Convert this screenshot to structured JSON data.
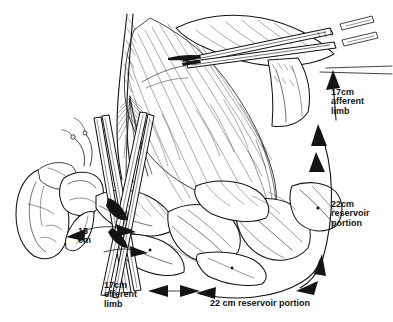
{
  "figure": {
    "background_color": "#ffffff",
    "ink_color": "#111111",
    "width": 393,
    "height": 322
  },
  "labels": {
    "afferent_limb_top": "17cm\nafferent\nlimb",
    "reservoir_right": "22cm\nreservoir\nportion",
    "ureter_segment": "15\ncm",
    "efferent_limb_bottom": "17cm\nefferent\nlimb",
    "reservoir_bottom": "22 cm  reservoir portion"
  },
  "measurements": [
    {
      "name": "afferent-limb",
      "value": "17",
      "unit": "cm",
      "text": "17cm afferent limb"
    },
    {
      "name": "reservoir-right",
      "value": "22",
      "unit": "cm",
      "text": "22cm reservoir portion"
    },
    {
      "name": "ureter-segment",
      "value": "15",
      "unit": "cm",
      "text": "15 cm"
    },
    {
      "name": "efferent-limb",
      "value": "17",
      "unit": "cm",
      "text": "17cm efferent limb"
    },
    {
      "name": "reservoir-bottom",
      "value": "22",
      "unit": "cm",
      "text": "22 cm reservoir portion"
    }
  ],
  "anatomy": [
    {
      "name": "kidney",
      "description": "left kidney, lower-left of figure"
    },
    {
      "name": "renal-pelvis",
      "description": "renal pelvis and calyces"
    },
    {
      "name": "ureter",
      "description": "ureter descending from renal pelvis"
    },
    {
      "name": "mesentery",
      "description": "fan-shaped small bowel mesentery with vessels"
    },
    {
      "name": "bowel-loops",
      "description": "coiled small bowel loops forming reservoir"
    },
    {
      "name": "afferent-limb-bowel",
      "description": "afferent bowel limb at upper right"
    },
    {
      "name": "efferent-limb-bowel",
      "description": "efferent bowel limb at lower left"
    }
  ],
  "instruments": [
    {
      "name": "forceps-upper-right",
      "description": "long clamp across upper bowel"
    },
    {
      "name": "forceps-center-left",
      "description": "crossed forceps at mesenteric window"
    },
    {
      "name": "forceps-lower-left",
      "description": "clamp near ureter"
    }
  ]
}
